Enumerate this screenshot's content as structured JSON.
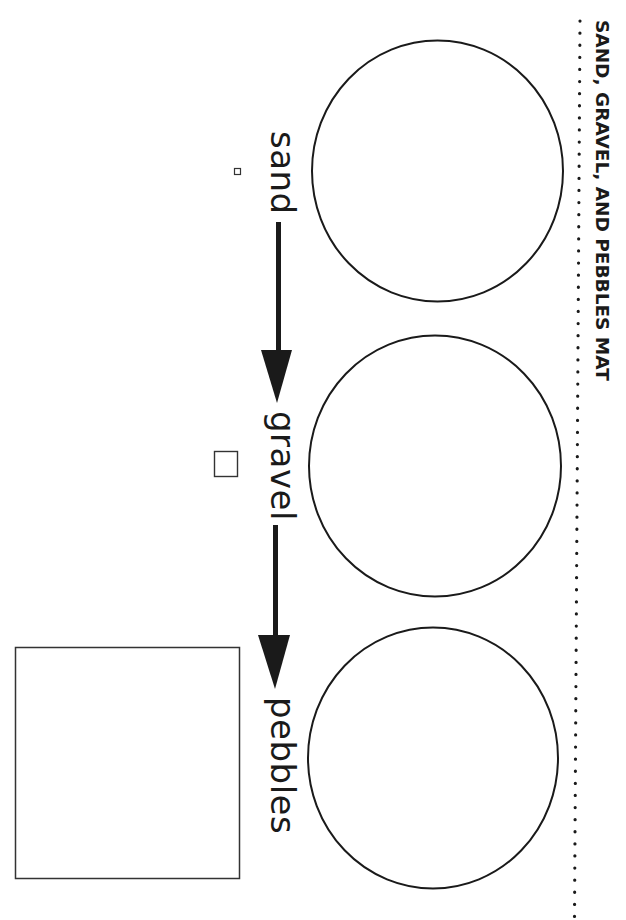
{
  "document": {
    "title": "SAND, GRAVEL, AND PEBBLES MAT",
    "orientation": "rotated 90deg clockwise"
  },
  "sequence": {
    "labels": [
      {
        "id": "sand",
        "text": "sand"
      },
      {
        "id": "gravel",
        "text": "gravel"
      },
      {
        "id": "pebbles",
        "text": "pebbles"
      }
    ],
    "arrows": [
      {
        "from": "sand",
        "to": "gravel"
      },
      {
        "from": "gravel",
        "to": "pebbles"
      }
    ]
  },
  "sorting_circles": [
    {
      "id": "circle-sand",
      "empty": true
    },
    {
      "id": "circle-gravel",
      "empty": true
    },
    {
      "id": "circle-pebbles",
      "empty": true
    }
  ],
  "size_squares": [
    {
      "id": "sand-size-square",
      "relative_size": "small"
    },
    {
      "id": "gravel-size-square",
      "relative_size": "medium"
    },
    {
      "id": "pebbles-size-square",
      "relative_size": "large"
    }
  ],
  "colors": {
    "ink": "#1a1a1a",
    "background": "#ffffff"
  }
}
